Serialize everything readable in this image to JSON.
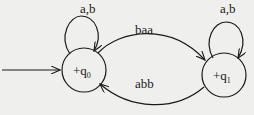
{
  "diagram": {
    "type": "finite-automaton",
    "states": [
      {
        "id": "q0",
        "label_prefix": "+q",
        "label_sub": "0",
        "initial": true
      },
      {
        "id": "q1",
        "label_prefix": "+q",
        "label_sub": "1",
        "initial": false
      }
    ],
    "transitions": [
      {
        "from": "q0",
        "to": "q0",
        "label": "a,b"
      },
      {
        "from": "q1",
        "to": "q1",
        "label": "a,b"
      },
      {
        "from": "q0",
        "to": "q1",
        "label": "baa"
      },
      {
        "from": "q1",
        "to": "q0",
        "label": "abb"
      }
    ]
  },
  "colors": {
    "stroke": "#1a1a1a",
    "background": "#efefed"
  }
}
